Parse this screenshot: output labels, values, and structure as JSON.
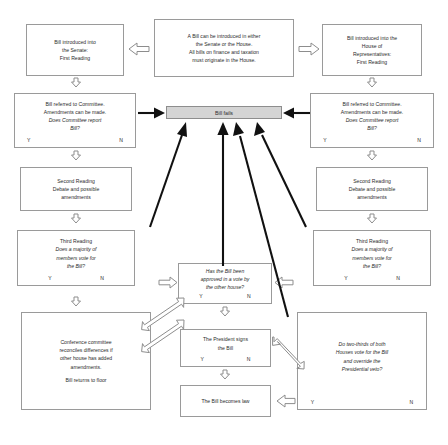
{
  "diagram": {
    "type": "flowchart",
    "colors": {
      "box_border": "#9a9a9a",
      "box_fill": "#ffffff",
      "fail_fill": "#d4d4d4",
      "arrow_solid": "#111111",
      "arrow_hollow_stroke": "#8d8d8d",
      "text": "#2b2b2b"
    },
    "labels": {
      "yes": "Y",
      "no": "N"
    },
    "nodes": {
      "intro_note": {
        "lines": [
          "A Bill can be introduced in either",
          "the Senate or the House.",
          "All bills on finance and taxation",
          "must originate in the House."
        ]
      },
      "senate_first_reading": {
        "lines": [
          "Bill introduced into",
          "the Senate:",
          "First Reading"
        ]
      },
      "house_first_reading": {
        "lines": [
          "Bill introduced into the",
          "House of",
          "Representatives:",
          "First Reading"
        ]
      },
      "senate_committee": {
        "lines": [
          "Bill referred to Committee.",
          "Amendments can be made."
        ],
        "question": [
          "Does Committee report",
          "Bill?"
        ]
      },
      "house_committee": {
        "lines": [
          "Bill referred to Committee.",
          "Amendments can be made."
        ],
        "question": [
          "Does Committee report",
          "Bill?"
        ]
      },
      "bill_fails": {
        "label": "Bill fails"
      },
      "senate_second_reading": {
        "lines": [
          "Second Reading",
          "Debate and possible",
          "amendments"
        ]
      },
      "house_second_reading": {
        "lines": [
          "Second Reading",
          "Debate and possible",
          "amendments"
        ]
      },
      "senate_third_reading": {
        "lines": [
          "Third Reading"
        ],
        "question": [
          "Does a majority of",
          "members vote for",
          "the Bill?"
        ]
      },
      "house_third_reading": {
        "lines": [
          "Third Reading"
        ],
        "question": [
          "Does a majority of",
          "members vote for",
          "the Bill?"
        ]
      },
      "other_house_vote": {
        "question": [
          "Has the Bill been",
          "approved in a vote by",
          "the other house?"
        ]
      },
      "conference_committee": {
        "lines": [
          "Conference committee",
          "reconciles differences if",
          "other house has added",
          "amendments."
        ],
        "footer": "Bill returns to floor"
      },
      "president_signs": {
        "lines": [
          "The President signs",
          "the Bill"
        ]
      },
      "veto_override": {
        "question": [
          "Do two-thirds of both",
          "Houses vote for the Bill",
          "and override the",
          "Presidential veto?"
        ]
      },
      "becomes_law": {
        "label": "The Bill becomes law"
      }
    }
  }
}
